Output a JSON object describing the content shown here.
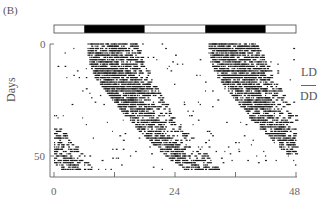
{
  "panel_label": "(B)",
  "chart_data": {
    "type": "actogram",
    "title": "",
    "double_plotted": true,
    "xlabel": "",
    "ylabel": "Days",
    "x_ticks": [
      0,
      12,
      24,
      36,
      48
    ],
    "x_tick_labels": [
      "0",
      "",
      "24",
      "",
      "48"
    ],
    "y_ticks": [
      0,
      50
    ],
    "y_tick_labels": [
      "0",
      "50"
    ],
    "xlim": [
      0,
      48
    ],
    "ylim": [
      0,
      58
    ],
    "light_dark_bar": [
      {
        "start": 0,
        "end": 6,
        "state": "light"
      },
      {
        "start": 6,
        "end": 18,
        "state": "dark"
      },
      {
        "start": 18,
        "end": 30,
        "state": "light"
      },
      {
        "start": 30,
        "end": 42,
        "state": "dark"
      },
      {
        "start": 42,
        "end": 48,
        "state": "light"
      }
    ],
    "conditions": [
      {
        "label": "LD"
      },
      {
        "label": "DD"
      }
    ],
    "activity_onset_hours": {
      "days": [
        0,
        5,
        10,
        15,
        20,
        25,
        30,
        35,
        40,
        45,
        50,
        55,
        58
      ],
      "onset": [
        6.5,
        6.6,
        7.0,
        8.0,
        9.5,
        11.2,
        13.0,
        15.0,
        17.2,
        19.5,
        22.0,
        24.5,
        26.0
      ]
    },
    "activity_duration_hours": {
      "days": [
        0,
        10,
        20,
        30,
        40,
        50,
        58
      ],
      "duration": [
        10,
        11,
        11,
        10,
        9,
        8,
        7
      ]
    },
    "colors": {
      "activity": "#1a1a1a",
      "dark": "#000000",
      "light": "#ffffff",
      "axis": "#666666"
    }
  },
  "labels": {
    "ld": "LD",
    "dd": "DD",
    "x0": "0",
    "x24": "24",
    "x48": "48",
    "y0": "0",
    "y50": "50",
    "days": "Days"
  }
}
